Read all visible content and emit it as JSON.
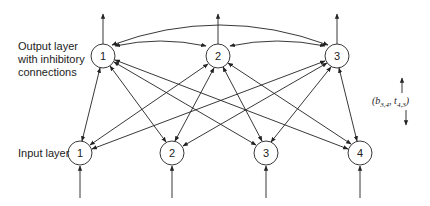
{
  "labels": {
    "output_layer_line1": "Output layer",
    "output_layer_line2": "with inhibitory",
    "output_layer_line3": "connections",
    "input_layer": "Input layer",
    "param_open": "(",
    "param_b": "b",
    "param_b_sub": "3,4",
    "param_sep": ", ",
    "param_t": "t",
    "param_t_sub": "4,3",
    "param_close": ")"
  },
  "output_nodes": [
    {
      "label": "1",
      "cx": 103,
      "cy": 56
    },
    {
      "label": "2",
      "cx": 218,
      "cy": 56
    },
    {
      "label": "3",
      "cx": 337,
      "cy": 56
    }
  ],
  "input_nodes": [
    {
      "label": "1",
      "cx": 80,
      "cy": 153
    },
    {
      "label": "2",
      "cx": 172,
      "cy": 153
    },
    {
      "label": "3",
      "cx": 266,
      "cy": 153
    },
    {
      "label": "4",
      "cx": 360,
      "cy": 153
    }
  ],
  "connections": {
    "input_to_output": "bidirectional, fully connected",
    "output_lateral": "bidirectional inhibitory (1-2, 2-3, 1-3)"
  },
  "colors": {
    "stroke": "#222222",
    "background": "#ffffff"
  }
}
